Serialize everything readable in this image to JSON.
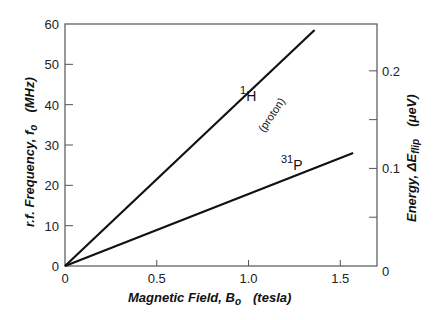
{
  "chart_data": {
    "type": "line",
    "title": "",
    "xlabel": "Magnetic Field, B",
    "xlabel_sub": "o",
    "xlabel_unit": "(tesla)",
    "ylabel": "r.f. Frequency, f",
    "ylabel_sub": "o",
    "ylabel_unit": "(MHz)",
    "y2label": "Energy, ΔE",
    "y2label_sub": "flip",
    "y2label_unit": "(μeV)",
    "xlim": [
      0,
      1.7
    ],
    "ylim": [
      0,
      60
    ],
    "y2lim": [
      0,
      0.248
    ],
    "xticks": [
      {
        "value": 0,
        "label": "0"
      },
      {
        "value": 0.5,
        "label": "0.5"
      },
      {
        "value": 1.0,
        "label": "1.0"
      },
      {
        "value": 1.5,
        "label": "1.5"
      }
    ],
    "yticks": [
      {
        "value": 0,
        "label": "0"
      },
      {
        "value": 10,
        "label": "10"
      },
      {
        "value": 20,
        "label": "20"
      },
      {
        "value": 30,
        "label": "30"
      },
      {
        "value": 40,
        "label": "40"
      },
      {
        "value": 50,
        "label": "50"
      },
      {
        "value": 60,
        "label": "60"
      }
    ],
    "y2ticks": [
      {
        "value": 0,
        "label": "0"
      },
      {
        "value": 0.05,
        "label": ""
      },
      {
        "value": 0.1,
        "label": "0.1"
      },
      {
        "value": 0.15,
        "label": ""
      },
      {
        "value": 0.2,
        "label": "0.2"
      }
    ],
    "grid": false,
    "legend": "none",
    "series": [
      {
        "name": "1H (proton)",
        "label_main": "H",
        "label_sup": "1",
        "label_note": "(proton)",
        "x": [
          0,
          1.36
        ],
        "y": [
          0,
          58.5
        ]
      },
      {
        "name": "31P",
        "label_main": "P",
        "label_sup": "31",
        "label_note": "",
        "x": [
          0,
          1.57
        ],
        "y": [
          0,
          28.0
        ]
      }
    ]
  }
}
